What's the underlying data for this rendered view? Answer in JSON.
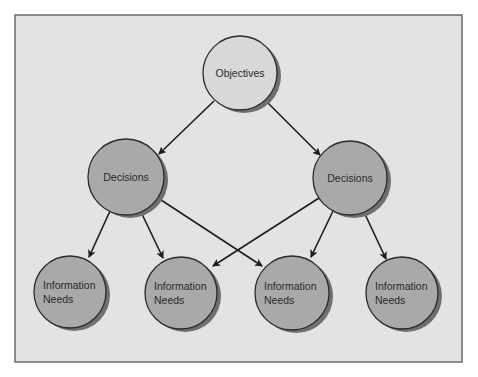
{
  "diagram": {
    "frame": {
      "x": 15,
      "y": 15,
      "width": 447,
      "height": 347,
      "fill": "#e3e3e3",
      "stroke": "#6a6a6a"
    },
    "colors": {
      "root_fill": "#d8d8d8",
      "node_fill": "#a9a9a9",
      "shadow": "#6f6f6f",
      "stroke": "#2b2b2b",
      "arrow": "#1e1e1e"
    },
    "nodes": [
      {
        "id": "objectives",
        "name": "objectives-node",
        "level": 0,
        "cx": 240,
        "cy": 73,
        "r": 37,
        "lines": [
          "Objectives"
        ],
        "align": "center"
      },
      {
        "id": "decisions-left",
        "name": "decisions-node-left",
        "level": 1,
        "cx": 126,
        "cy": 177,
        "r": 38,
        "lines": [
          "Decisions"
        ],
        "align": "center"
      },
      {
        "id": "decisions-right",
        "name": "decisions-node-right",
        "level": 1,
        "cx": 350,
        "cy": 178,
        "r": 37,
        "lines": [
          "Decisions"
        ],
        "align": "center"
      },
      {
        "id": "info-1",
        "name": "information-needs-node-1",
        "level": 2,
        "cx": 70,
        "cy": 292,
        "r": 36,
        "lines": [
          "Information",
          "Needs"
        ],
        "align": "left"
      },
      {
        "id": "info-2",
        "name": "information-needs-node-2",
        "level": 2,
        "cx": 181,
        "cy": 293,
        "r": 36,
        "lines": [
          "Information",
          "Needs"
        ],
        "align": "left"
      },
      {
        "id": "info-3",
        "name": "information-needs-node-3",
        "level": 2,
        "cx": 292,
        "cy": 293,
        "r": 37,
        "lines": [
          "Information",
          "Needs"
        ],
        "align": "left"
      },
      {
        "id": "info-4",
        "name": "information-needs-node-4",
        "level": 2,
        "cx": 402,
        "cy": 293,
        "r": 36,
        "lines": [
          "Information",
          "Needs"
        ],
        "align": "left"
      }
    ],
    "edges": [
      {
        "from": "objectives",
        "to": "decisions-left",
        "x1": 214,
        "y1": 101,
        "x2": 159,
        "y2": 154
      },
      {
        "from": "objectives",
        "to": "decisions-right",
        "x1": 267,
        "y1": 102,
        "x2": 320,
        "y2": 155
      },
      {
        "from": "decisions-left",
        "to": "info-1",
        "x1": 110,
        "y1": 211,
        "x2": 89,
        "y2": 257
      },
      {
        "from": "decisions-left",
        "to": "info-2",
        "x1": 141,
        "y1": 212,
        "x2": 163,
        "y2": 258
      },
      {
        "from": "decisions-left",
        "to": "info-3",
        "x1": 158,
        "y1": 198,
        "x2": 262,
        "y2": 266
      },
      {
        "from": "decisions-right",
        "to": "info-2",
        "x1": 319,
        "y1": 198,
        "x2": 213,
        "y2": 266
      },
      {
        "from": "decisions-right",
        "to": "info-3",
        "x1": 333,
        "y1": 211,
        "x2": 311,
        "y2": 257
      },
      {
        "from": "decisions-right",
        "to": "info-4",
        "x1": 364,
        "y1": 212,
        "x2": 386,
        "y2": 259
      }
    ]
  }
}
